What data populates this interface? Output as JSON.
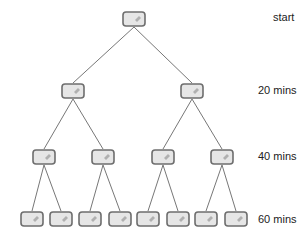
{
  "diagram": {
    "type": "binary-tree",
    "levels": [
      {
        "label": "start",
        "node_count": 1
      },
      {
        "label": "20 mins",
        "node_count": 2
      },
      {
        "label": "40 mins",
        "node_count": 4
      },
      {
        "label": "60 mins",
        "node_count": 8
      }
    ],
    "node_icon": "bacterium-cell-icon",
    "colors": {
      "node_fill": "#e6e6e6",
      "node_stroke": "#6e6e6e",
      "node_highlight": "#b0b0b0",
      "edge": "#777777",
      "label_text": "#222222"
    }
  }
}
